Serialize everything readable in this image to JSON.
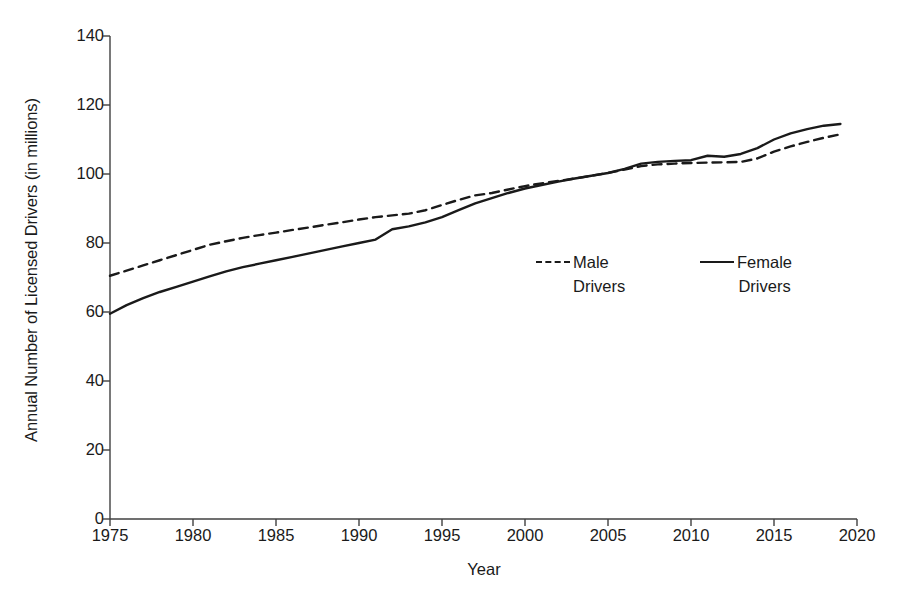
{
  "chart_data": {
    "type": "line",
    "title": "",
    "xlabel": "Year",
    "ylabel": "Annual Number of Licensed Drivers (in millions)",
    "xlim": [
      1975,
      2020
    ],
    "ylim": [
      0,
      140
    ],
    "xticks": [
      1975,
      1980,
      1985,
      1990,
      1995,
      2000,
      2005,
      2010,
      2015,
      2020
    ],
    "yticks": [
      0,
      20,
      40,
      60,
      80,
      100,
      120,
      140
    ],
    "grid": false,
    "legend_position": "center-right-inside",
    "x": [
      1975,
      1976,
      1977,
      1978,
      1979,
      1980,
      1981,
      1982,
      1983,
      1984,
      1985,
      1986,
      1987,
      1988,
      1989,
      1990,
      1991,
      1992,
      1993,
      1994,
      1995,
      1996,
      1997,
      1998,
      1999,
      2000,
      2001,
      2002,
      2003,
      2004,
      2005,
      2006,
      2007,
      2008,
      2009,
      2010,
      2011,
      2012,
      2013,
      2014,
      2015,
      2016,
      2017,
      2018,
      2019
    ],
    "series": [
      {
        "name": "Male Drivers",
        "style": "dashed",
        "color": "#1a1a1a",
        "values": [
          70.5,
          72.0,
          73.5,
          75.0,
          76.5,
          78.0,
          79.5,
          80.5,
          81.5,
          82.3,
          83.0,
          83.8,
          84.5,
          85.3,
          86.0,
          86.8,
          87.5,
          88.0,
          88.5,
          89.5,
          91.0,
          92.5,
          93.8,
          94.5,
          95.5,
          96.5,
          97.3,
          98.0,
          98.7,
          99.5,
          100.3,
          101.3,
          102.3,
          102.8,
          103.0,
          103.2,
          103.3,
          103.4,
          103.5,
          104.5,
          106.5,
          108.0,
          109.3,
          110.5,
          111.5
        ]
      },
      {
        "name": "Female Drivers",
        "style": "solid",
        "color": "#1a1a1a",
        "values": [
          59.5,
          62.0,
          64.0,
          65.8,
          67.3,
          68.8,
          70.3,
          71.8,
          73.0,
          74.0,
          75.0,
          76.0,
          77.0,
          78.0,
          79.0,
          80.0,
          81.0,
          84.0,
          84.8,
          86.0,
          87.5,
          89.5,
          91.5,
          93.0,
          94.5,
          95.8,
          96.8,
          97.8,
          98.7,
          99.5,
          100.3,
          101.5,
          103.0,
          103.5,
          103.8,
          104.0,
          105.3,
          105.0,
          105.8,
          107.5,
          110.0,
          111.8,
          113.0,
          114.0,
          114.5
        ]
      }
    ]
  },
  "axes": {
    "y_title": "Annual Number of Licensed Drivers (in millions)",
    "x_title": "Year",
    "y_tick_labels": [
      "140",
      "120",
      "100",
      "80",
      "60",
      "40",
      "20",
      "0"
    ],
    "x_tick_labels": [
      "1975",
      "1980",
      "1985",
      "1990",
      "1995",
      "2000",
      "2005",
      "2010",
      "2015",
      "2020"
    ]
  },
  "legend": {
    "male": {
      "line1": "Male",
      "line2": "Drivers",
      "style": "dashed"
    },
    "female": {
      "line1": "Female",
      "line2": "Drivers",
      "style": "solid"
    }
  },
  "colors": {
    "line": "#1a1a1a",
    "axis": "#404040",
    "background": "#ffffff"
  }
}
